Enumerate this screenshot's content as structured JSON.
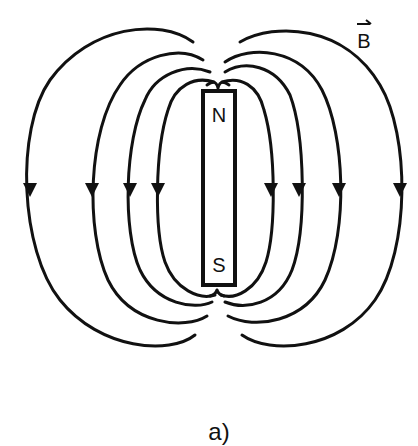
{
  "diagram": {
    "field_label": "B",
    "north_label": "N",
    "south_label": "S",
    "caption": "a)",
    "line_color": "#111111",
    "background": "#ffffff",
    "field_line_count": 8,
    "arrow_direction": "down"
  }
}
